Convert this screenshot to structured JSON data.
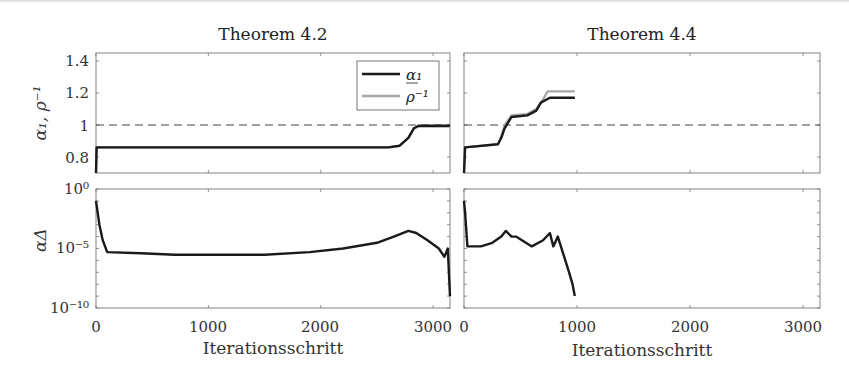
{
  "figure": {
    "titles": [
      "Theorem 4.2",
      "Theorem 4.4"
    ],
    "top_ylabel": "α₁, ρ⁻¹",
    "bottom_ylabel": "αΔ",
    "xlabel": "Iterationsschritt",
    "legend": [
      {
        "label": "α₁",
        "color": "#1a1a1a"
      },
      {
        "label": "ρ⁻¹",
        "color": "#a8a8a8"
      }
    ],
    "top_yticks": [
      "1.4",
      "1.2",
      "1",
      "0.8"
    ],
    "bottom_yticks": [
      "10⁰",
      "10⁻⁵",
      "10⁻¹⁰"
    ],
    "xticks_left": [
      "0",
      "1000",
      "2000",
      "3000"
    ],
    "xticks_right": [
      "0",
      "1000",
      "2000",
      "3000"
    ]
  },
  "chart_data": [
    {
      "type": "line",
      "title": "Theorem 4.2",
      "xlabel": "",
      "ylabel": "α₁, ρ⁻¹",
      "xlim": [
        0,
        3150
      ],
      "ylim": [
        0.7,
        1.45
      ],
      "reference_line": {
        "y": 1,
        "style": "dashed"
      },
      "legend_position": "upper right",
      "series": [
        {
          "name": "α₁",
          "color": "#1a1a1a",
          "x": [
            0,
            5,
            10,
            2600,
            2700,
            2780,
            2830,
            2870,
            3150
          ],
          "y": [
            0.7,
            0.86,
            0.86,
            0.86,
            0.87,
            0.92,
            0.98,
            0.995,
            0.995
          ]
        },
        {
          "name": "ρ⁻¹",
          "color": "#a8a8a8",
          "x": [
            0,
            5,
            10,
            2600,
            2700,
            2780,
            2830,
            2870,
            3150
          ],
          "y": [
            0.7,
            0.86,
            0.86,
            0.86,
            0.87,
            0.92,
            0.98,
            0.99,
            0.99
          ]
        }
      ]
    },
    {
      "type": "line",
      "title": "Theorem 4.4",
      "xlabel": "",
      "ylabel": "",
      "xlim": [
        0,
        3150
      ],
      "ylim": [
        0.7,
        1.45
      ],
      "reference_line": {
        "y": 1,
        "style": "dashed"
      },
      "series": [
        {
          "name": "α₁",
          "color": "#1a1a1a",
          "x": [
            0,
            10,
            300,
            330,
            360,
            420,
            560,
            640,
            680,
            760,
            980
          ],
          "y": [
            0.7,
            0.86,
            0.88,
            0.92,
            0.98,
            1.05,
            1.06,
            1.09,
            1.14,
            1.17,
            1.17
          ]
        },
        {
          "name": "ρ⁻¹",
          "color": "#a8a8a8",
          "x": [
            0,
            10,
            300,
            330,
            360,
            420,
            560,
            640,
            700,
            740,
            980
          ],
          "y": [
            0.7,
            0.86,
            0.88,
            0.93,
            1.0,
            1.06,
            1.07,
            1.1,
            1.16,
            1.21,
            1.21
          ]
        }
      ]
    },
    {
      "type": "line",
      "title": "",
      "xlabel": "Iterationsschritt",
      "ylabel": "αΔ",
      "yscale": "log",
      "xlim": [
        0,
        3150
      ],
      "ylim": [
        1e-10,
        1
      ],
      "series": [
        {
          "name": "αΔ",
          "color": "#1a1a1a",
          "x": [
            0,
            30,
            60,
            100,
            400,
            700,
            1000,
            1500,
            1900,
            2200,
            2500,
            2650,
            2780,
            2850,
            2950,
            3050,
            3100,
            3130,
            3150
          ],
          "y": [
            0.1,
            0.001,
            5e-05,
            5e-06,
            4e-06,
            3e-06,
            3e-06,
            3e-06,
            5e-06,
            1e-05,
            3e-05,
            0.0001,
            0.0003,
            0.0002,
            5e-05,
            1e-05,
            2e-06,
            1e-05,
            1e-09
          ]
        }
      ]
    },
    {
      "type": "line",
      "title": "",
      "xlabel": "Iterationsschritt",
      "ylabel": "",
      "yscale": "log",
      "xlim": [
        0,
        3150
      ],
      "ylim": [
        1e-10,
        1
      ],
      "series": [
        {
          "name": "αΔ",
          "color": "#1a1a1a",
          "x": [
            0,
            10,
            30,
            150,
            250,
            330,
            370,
            420,
            460,
            600,
            700,
            760,
            790,
            830,
            880,
            930,
            960,
            980
          ],
          "y": [
            0.1,
            0.01,
            1.5e-05,
            1.5e-05,
            3e-05,
            0.0001,
            0.0003,
            0.0001,
            0.0001,
            1.5e-05,
            5e-05,
            0.0002,
            1.5e-05,
            0.0001,
            3e-06,
            1e-07,
            1e-08,
            1e-09
          ]
        }
      ]
    }
  ]
}
